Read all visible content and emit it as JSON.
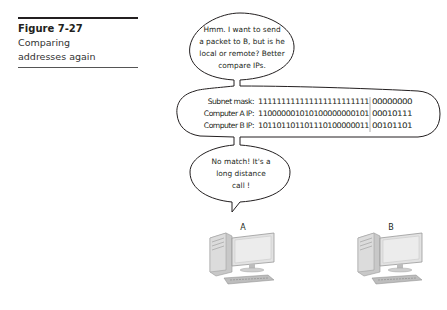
{
  "caption": {
    "figure_label": "Figure 7-27",
    "line1": "Comparing",
    "line2": "addresses again"
  },
  "bubble_top": {
    "lines": [
      "Hmm. I want to send",
      "a packet to B, but is he",
      "local or remote? Better",
      "compare IPs."
    ]
  },
  "comparison": {
    "rows": [
      {
        "label": "Subnet mask:",
        "network_bits": "111111111111111111111111",
        "host_bits": "00000000"
      },
      {
        "label": "Computer A IP:",
        "network_bits": "110000001010100000000101",
        "host_bits": "00010111"
      },
      {
        "label": "Computer B IP:",
        "network_bits": "101101101101110100000011",
        "host_bits": "00101101"
      }
    ]
  },
  "bubble_bottom": {
    "lines": [
      "No match! It's a",
      "long distance",
      "call !"
    ]
  },
  "computers": [
    {
      "label": "A"
    },
    {
      "label": "B"
    }
  ],
  "colors": {
    "ink": "#231f20",
    "computer_body": "#c8c8c8",
    "screen": "#e2e2e2"
  }
}
